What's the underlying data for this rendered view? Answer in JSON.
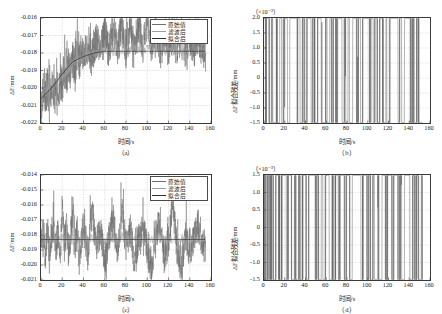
{
  "figure": {
    "axis_color": "#3a3a3a",
    "grid_color": "#b9b9b9",
    "series_colors": {
      "original": "#6e6e6e",
      "filtered": "#9e9e9e",
      "fitted": "#303030"
    }
  },
  "legend": {
    "items": [
      {
        "label": "原始值",
        "color": "#6e6e6e"
      },
      {
        "label": "滤波后",
        "color": "#9e9e9e"
      },
      {
        "label": "拟合后",
        "color": "#303030"
      }
    ]
  },
  "panels": {
    "a": {
      "caption": "（a）",
      "xlabel": "时间/s",
      "ylabel": "ΔF/mm",
      "exponent": "",
      "xticks": [
        "0",
        "20",
        "40",
        "60",
        "80",
        "100",
        "120",
        "140",
        "160"
      ],
      "yticks": [
        "-0.016",
        "-0.017",
        "-0.018",
        "-0.019",
        "-0.020",
        "-0.021",
        "-0.022"
      ]
    },
    "b": {
      "caption": "（b）",
      "xlabel": "时间/s",
      "ylabel": "ΔF拟合残差/mm",
      "exponent": "（×10⁻³）",
      "xticks": [
        "0",
        "20",
        "40",
        "60",
        "80",
        "100",
        "120",
        "140",
        "160"
      ],
      "yticks": [
        "2.0",
        "1.5",
        "1.0",
        "0.5",
        "0",
        "-0.5",
        "-1.0",
        "-1.5"
      ]
    },
    "c": {
      "caption": "（c）",
      "xlabel": "时间/s",
      "ylabel": "ΔF/mm",
      "exponent": "",
      "xticks": [
        "0",
        "20",
        "40",
        "60",
        "80",
        "100",
        "120",
        "140",
        "160"
      ],
      "yticks": [
        "-0.014",
        "-0.015",
        "-0.016",
        "-0.017",
        "-0.018",
        "-0.019",
        "-0.020",
        "-0.021"
      ]
    },
    "d": {
      "caption": "（d）",
      "xlabel": "时间/s",
      "ylabel": "ΔF拟合残差/mm",
      "exponent": "（×10⁻³）",
      "xticks": [
        "0",
        "20",
        "40",
        "60",
        "80",
        "100",
        "120",
        "140",
        "160"
      ],
      "yticks": [
        "1.5",
        "1.0",
        "0.5",
        "0",
        "-0.5",
        "-1.0",
        "-1.5"
      ]
    }
  },
  "chart_data": [
    {
      "id": "a",
      "type": "line",
      "title": "（a）",
      "xlabel": "时间/s",
      "ylabel": "ΔF/mm",
      "xlim": [
        0,
        160
      ],
      "ylim": [
        -0.022,
        -0.016
      ],
      "grid": true,
      "legend_position": "top-right",
      "units_note": "",
      "series": [
        {
          "name": "原始值",
          "color": "#6e6e6e",
          "description": "Noisy raw signal, rises from about -0.0205 near t=0 to a plateau near -0.0180 after t=40, with spikes reaching -0.016 and dips to -0.0215",
          "x": [
            0,
            2,
            4,
            6,
            8,
            10,
            12,
            14,
            16,
            18,
            20,
            22,
            24,
            26,
            28,
            30,
            32,
            34,
            36,
            38,
            40,
            44,
            48,
            52,
            56,
            60,
            64,
            68,
            72,
            76,
            80,
            84,
            88,
            92,
            96,
            100,
            104,
            108,
            112,
            116,
            120,
            124,
            128,
            132,
            136,
            140,
            144,
            148,
            152
          ],
          "values": [
            -0.0212,
            -0.0201,
            -0.0207,
            -0.0199,
            -0.021,
            -0.0197,
            -0.0204,
            -0.02,
            -0.0209,
            -0.0196,
            -0.0198,
            -0.019,
            -0.0194,
            -0.0187,
            -0.0192,
            -0.0183,
            -0.0189,
            -0.018,
            -0.0186,
            -0.0178,
            -0.0184,
            -0.0176,
            -0.0183,
            -0.0172,
            -0.0181,
            -0.0168,
            -0.018,
            -0.0165,
            -0.0179,
            -0.0162,
            -0.0178,
            -0.0164,
            -0.0179,
            -0.0161,
            -0.0178,
            -0.016,
            -0.0177,
            -0.0166,
            -0.0179,
            -0.017,
            -0.0178,
            -0.0168,
            -0.0179,
            -0.0167,
            -0.0178,
            -0.0169,
            -0.0179,
            -0.017,
            -0.018
          ]
        },
        {
          "name": "滤波后",
          "color": "#9e9e9e",
          "description": "Filtered signal, smoother version tracking the raw data trend with reduced amplitude",
          "x": [
            0,
            10,
            20,
            30,
            40,
            50,
            60,
            70,
            80,
            90,
            100,
            110,
            120,
            130,
            140,
            150
          ],
          "values": [
            -0.0204,
            -0.02,
            -0.0194,
            -0.0186,
            -0.0182,
            -0.018,
            -0.0179,
            -0.0179,
            -0.0178,
            -0.0178,
            -0.0178,
            -0.0178,
            -0.0179,
            -0.0179,
            -0.0179,
            -0.0179
          ]
        },
        {
          "name": "拟合后",
          "color": "#303030",
          "description": "Fitted curve: exponential-like rise saturating near -0.0179",
          "x": [
            0,
            10,
            20,
            30,
            40,
            50,
            60,
            70,
            80,
            90,
            100,
            110,
            120,
            130,
            140,
            150,
            160
          ],
          "values": [
            -0.0206,
            -0.02,
            -0.0192,
            -0.0185,
            -0.0182,
            -0.018,
            -0.0179,
            -0.0179,
            -0.0179,
            -0.0179,
            -0.0179,
            -0.0179,
            -0.0179,
            -0.0179,
            -0.0179,
            -0.0179,
            -0.0179
          ]
        }
      ]
    },
    {
      "id": "b",
      "type": "line",
      "title": "（b）",
      "xlabel": "时间/s",
      "ylabel": "ΔF拟合残差/mm",
      "xlim": [
        0,
        160
      ],
      "ylim": [
        -1.5,
        2.0
      ],
      "y_scale": 0.001,
      "units_note": "（×10⁻³）",
      "grid": true,
      "series": [
        {
          "name": "拟合残差",
          "color": "#5a5a5a",
          "description": "Zero-mean residual noise roughly within ±1.0×10⁻³, a few excursions to +1.1 and -1.2",
          "x": [
            0,
            2,
            4,
            6,
            8,
            10,
            12,
            14,
            16,
            18,
            20,
            22,
            24,
            26,
            28,
            30,
            32,
            34,
            36,
            38,
            40,
            42,
            44,
            46,
            48,
            50,
            52,
            54,
            56,
            58,
            60,
            62,
            64,
            66,
            68,
            70,
            72,
            74,
            76,
            78,
            80,
            82,
            84,
            86,
            88,
            90,
            92,
            94,
            96,
            98,
            100,
            102,
            104,
            106,
            108,
            110,
            112,
            114,
            116,
            118,
            120,
            122,
            124,
            126,
            128,
            130,
            132,
            134,
            136,
            138,
            140,
            142,
            144,
            146,
            148,
            150,
            152
          ],
          "values": [
            0.3,
            -0.2,
            0.4,
            -0.5,
            0.2,
            -1.2,
            0.1,
            -0.4,
            0.5,
            -0.3,
            0.2,
            0.4,
            -0.6,
            0.6,
            0.3,
            0.7,
            -0.2,
            0.5,
            -0.4,
            0.3,
            -0.5,
            0.2,
            0.5,
            -0.3,
            0.4,
            -0.6,
            0.2,
            0.4,
            -0.2,
            -1.0,
            0.3,
            -0.5,
            0.4,
            -0.3,
            0.5,
            -0.2,
            0.3,
            0.6,
            -0.4,
            0.2,
            -0.5,
            0.3,
            -0.9,
            0.4,
            0.7,
            -0.3,
            0.5,
            -0.6,
            0.3,
            0.8,
            1.1,
            -0.4,
            0.5,
            -0.3,
            0.6,
            -0.5,
            0.2,
            0.4,
            -0.7,
            0.3,
            -1.0,
            0.4,
            0.3,
            0.4,
            0.4,
            -0.4,
            0.5,
            -0.6,
            0.3,
            0.9,
            0.4,
            -0.3,
            0.2,
            -0.5,
            0.3,
            -0.4,
            -0.5
          ]
        }
      ]
    },
    {
      "id": "c",
      "type": "line",
      "title": "（c）",
      "xlabel": "时间/s",
      "ylabel": "ΔF/mm",
      "xlim": [
        0,
        160
      ],
      "ylim": [
        -0.021,
        -0.014
      ],
      "grid": true,
      "legend_position": "top-right",
      "series": [
        {
          "name": "原始值",
          "color": "#6e6e6e",
          "description": "Stationary noisy signal centered near -0.0183 with spikes up to -0.0160 and dips to -0.0205",
          "x": [
            0,
            2,
            4,
            6,
            8,
            10,
            12,
            14,
            16,
            18,
            20,
            22,
            24,
            26,
            28,
            30,
            32,
            34,
            36,
            38,
            40,
            44,
            48,
            52,
            56,
            60,
            64,
            68,
            72,
            76,
            80,
            84,
            88,
            92,
            96,
            100,
            104,
            108,
            112,
            116,
            120,
            124,
            128,
            132,
            136,
            140,
            144,
            148,
            152
          ],
          "values": [
            -0.0186,
            -0.0178,
            -0.0192,
            -0.0175,
            -0.0196,
            -0.018,
            -0.0172,
            -0.019,
            -0.0177,
            -0.02,
            -0.016,
            -0.0188,
            -0.0175,
            -0.0195,
            -0.0182,
            -0.0162,
            -0.019,
            -0.0176,
            -0.0198,
            -0.0184,
            -0.0173,
            -0.0193,
            -0.0164,
            -0.0186,
            -0.0178,
            -0.0199,
            -0.0182,
            -0.017,
            -0.0194,
            -0.0161,
            -0.0187,
            -0.0175,
            -0.0197,
            -0.0183,
            -0.0174,
            -0.0191,
            -0.0204,
            -0.018,
            -0.0172,
            -0.0196,
            -0.0184,
            -0.0159,
            -0.0189,
            -0.0205,
            -0.0177,
            -0.0193,
            -0.0181,
            -0.0173,
            -0.0188
          ]
        },
        {
          "name": "滤波后",
          "color": "#9e9e9e",
          "description": "Filtered trace oscillating tightly around -0.0183",
          "x": [
            0,
            10,
            20,
            30,
            40,
            50,
            60,
            70,
            80,
            90,
            100,
            110,
            120,
            130,
            140,
            150
          ],
          "values": [
            -0.0184,
            -0.0183,
            -0.0182,
            -0.0184,
            -0.0183,
            -0.0182,
            -0.0184,
            -0.0183,
            -0.0183,
            -0.0182,
            -0.0184,
            -0.0183,
            -0.0183,
            -0.0184,
            -0.0183,
            -0.0183
          ]
        },
        {
          "name": "拟合后",
          "color": "#303030",
          "description": "Flat fitted line at about -0.0183",
          "x": [
            0,
            160
          ],
          "values": [
            -0.0183,
            -0.0183
          ]
        }
      ]
    },
    {
      "id": "d",
      "type": "line",
      "title": "（d）",
      "xlabel": "时间/s",
      "ylabel": "ΔF拟合残差/mm",
      "xlim": [
        0,
        160
      ],
      "ylim": [
        -1.5,
        1.5
      ],
      "y_scale": 0.001,
      "units_note": "（×10⁻³）",
      "grid": true,
      "series": [
        {
          "name": "拟合残差",
          "color": "#5a5a5a",
          "description": "Zero-mean residual noise mostly within ±0.7×10⁻³ with occasional peaks near +1.0 and troughs near -1.0",
          "x": [
            0,
            2,
            4,
            6,
            8,
            10,
            12,
            14,
            16,
            18,
            20,
            22,
            24,
            26,
            28,
            30,
            32,
            34,
            36,
            38,
            40,
            42,
            44,
            46,
            48,
            50,
            52,
            54,
            56,
            58,
            60,
            62,
            64,
            66,
            68,
            70,
            72,
            74,
            76,
            78,
            80,
            82,
            84,
            86,
            88,
            90,
            92,
            94,
            96,
            98,
            100,
            102,
            104,
            106,
            108,
            110,
            112,
            114,
            116,
            118,
            120,
            122,
            124,
            126,
            128,
            130,
            132,
            134,
            136,
            138,
            140,
            142,
            144,
            146,
            148,
            150,
            152
          ],
          "values": [
            0.1,
            -0.3,
            0.2,
            -0.2,
            0.3,
            -0.4,
            0.2,
            0.1,
            -0.3,
            0.2,
            0.7,
            -0.2,
            0.3,
            0.2,
            -0.5,
            0.1,
            -0.5,
            0.2,
            -0.4,
            0.3,
            0.5,
            -1.0,
            0.8,
            0.3,
            0.9,
            -0.3,
            0.2,
            -0.6,
            0.4,
            -0.5,
            0.3,
            0.4,
            -0.7,
            0.2,
            -0.4,
            0.5,
            -0.2,
            0.3,
            0.5,
            -0.3,
            0.2,
            0.4,
            -1.0,
            0.6,
            0.9,
            0.3,
            0.7,
            -0.3,
            0.2,
            0.4,
            -0.3,
            0.2,
            -0.5,
            0.3,
            -0.6,
            0.2,
            -0.8,
            0.3,
            0.4,
            -0.2,
            0.5,
            0.7,
            -0.4,
            0.3,
            0.6,
            -0.3,
            0.2,
            -0.5,
            0.4,
            0.8,
            0.5,
            -0.6,
            0.3,
            -0.2,
            0.2,
            -0.4,
            0.1
          ]
        }
      ]
    }
  ]
}
